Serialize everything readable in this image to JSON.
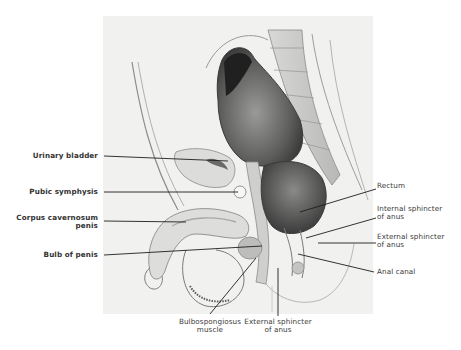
{
  "figure": {
    "labels_left": [
      {
        "id": "urinary-bladder",
        "lines": [
          "Urinary bladder"
        ]
      },
      {
        "id": "pubic-symphysis",
        "lines": [
          "Pubic symphysis"
        ]
      },
      {
        "id": "corpus-cavernosum-penis",
        "lines": [
          "Corpus cavernosum",
          "penis"
        ]
      },
      {
        "id": "bulb-of-penis",
        "lines": [
          "Bulb of penis"
        ]
      }
    ],
    "labels_right": [
      {
        "id": "rectum",
        "lines": [
          "Rectum"
        ]
      },
      {
        "id": "internal-sphincter-of-anus",
        "lines": [
          "Internal sphincter",
          "of anus"
        ]
      },
      {
        "id": "external-sphincter-of-anus-right",
        "lines": [
          "External sphincter",
          "of anus"
        ]
      },
      {
        "id": "anal-canal",
        "lines": [
          "Anal canal"
        ]
      }
    ],
    "labels_bottom": [
      {
        "id": "bulbospongiosus-muscle",
        "lines": [
          "Bulbospongiosus",
          "muscle"
        ]
      },
      {
        "id": "external-sphincter-of-anus-bottom",
        "lines": [
          "External sphincter",
          "of anus"
        ]
      }
    ],
    "colors": {
      "background": "#ffffff",
      "illustration_bg": "#f1f1ef",
      "leader_line": "#1e1e1e",
      "dark_tissue": "#2e2e2e",
      "mid_tissue": "#7a7a7a",
      "light_tissue": "#d6d6d4"
    }
  }
}
